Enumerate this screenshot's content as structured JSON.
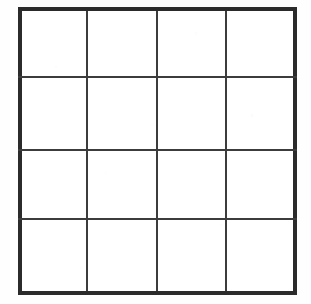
{
  "canvas": {
    "width": 311,
    "height": 304,
    "background_color": "#fefefe"
  },
  "figure": {
    "type": "grid",
    "rows": 4,
    "columns": 4,
    "cell_count": 16,
    "outer_border_color": "#2b2b2b",
    "inner_line_color": "#3c3c3c",
    "cell_fill_color": "#ffffff",
    "outer_border_width": 4,
    "inner_line_width": 2,
    "bounds": {
      "left": 20,
      "top": 9,
      "right": 295,
      "bottom": 293
    },
    "vertical_line_x": [
      20,
      87,
      157,
      226,
      295
    ],
    "horizontal_line_y": [
      9,
      77,
      150,
      219,
      293
    ],
    "cells": [
      {
        "row": 1,
        "column": 1,
        "label": ""
      },
      {
        "row": 1,
        "column": 2,
        "label": ""
      },
      {
        "row": 1,
        "column": 3,
        "label": ""
      },
      {
        "row": 1,
        "column": 4,
        "label": ""
      },
      {
        "row": 2,
        "column": 1,
        "label": ""
      },
      {
        "row": 2,
        "column": 2,
        "label": ""
      },
      {
        "row": 2,
        "column": 3,
        "label": ""
      },
      {
        "row": 2,
        "column": 4,
        "label": ""
      },
      {
        "row": 3,
        "column": 1,
        "label": ""
      },
      {
        "row": 3,
        "column": 2,
        "label": ""
      },
      {
        "row": 3,
        "column": 3,
        "label": ""
      },
      {
        "row": 3,
        "column": 4,
        "label": ""
      },
      {
        "row": 4,
        "column": 1,
        "label": ""
      },
      {
        "row": 4,
        "column": 2,
        "label": ""
      },
      {
        "row": 4,
        "column": 3,
        "label": ""
      },
      {
        "row": 4,
        "column": 4,
        "label": ""
      }
    ]
  }
}
